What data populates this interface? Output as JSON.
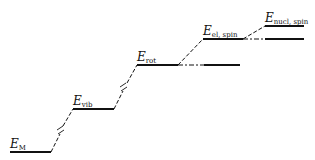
{
  "diagram": {
    "type": "energy-level-diagram",
    "levels": [
      {
        "id": "E_M",
        "symbol": "E",
        "subscript": "M"
      },
      {
        "id": "E_vib",
        "symbol": "E",
        "subscript": "vib"
      },
      {
        "id": "E_rot",
        "symbol": "E",
        "subscript": "rot"
      },
      {
        "id": "E_el_spin",
        "symbol": "E",
        "subscript": "el, spin"
      },
      {
        "id": "E_nucl_spin",
        "symbol": "E",
        "subscript": "nucl, spin"
      }
    ],
    "colors": {
      "line": "#111111",
      "background": "#ffffff"
    }
  }
}
